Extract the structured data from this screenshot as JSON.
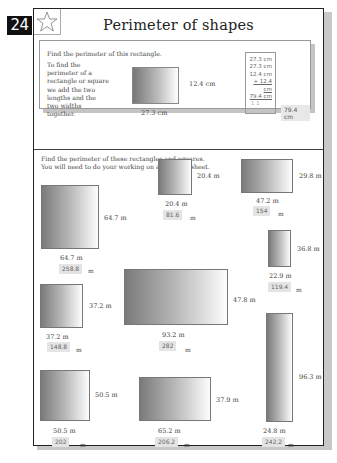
{
  "page": {
    "number": "24",
    "title": "Perimeter of shapes",
    "star_icon": "star-outline-icon"
  },
  "example": {
    "heading": "Find the perimeter of this rectangle.",
    "description": "To find the perimeter of a rectangle or square we add the two lengths and the two widths together.",
    "length_label": "27.3 cm",
    "width_label": "12.4 cm",
    "working": [
      "27.3 cm",
      "27.3 cm",
      "12.4 cm",
      "+ 12.4 cm",
      "79.4 cm",
      "1 1"
    ],
    "answer": "79.4 cm"
  },
  "exercise": {
    "instructions_line1": "Find the perimeter of these rectangles and squares.",
    "instructions_line2": "You will need to do your working on a separate sheet.",
    "unit": "m",
    "shapes": [
      {
        "length": "64.7 m",
        "width": "64.7 m",
        "answer": "258.8"
      },
      {
        "length": "20.4 m",
        "width": "20.4 m",
        "answer": "81.6"
      },
      {
        "length": "47.2 m",
        "width": "29.8 m",
        "answer": "154"
      },
      {
        "length": "22.9 m",
        "width": "36.8 m",
        "answer": "119.4"
      },
      {
        "length": "37.2 m",
        "width": "37.2 m",
        "answer": "148.8"
      },
      {
        "length": "93.2 m",
        "width": "47.8 m",
        "answer": "282"
      },
      {
        "length": "24.8 m",
        "width": "96.3 m",
        "answer": "242.2"
      },
      {
        "length": "50.5 m",
        "width": "50.5 m",
        "answer": "202"
      },
      {
        "length": "65.2 m",
        "width": "37.9 m",
        "answer": "206.2"
      }
    ]
  }
}
